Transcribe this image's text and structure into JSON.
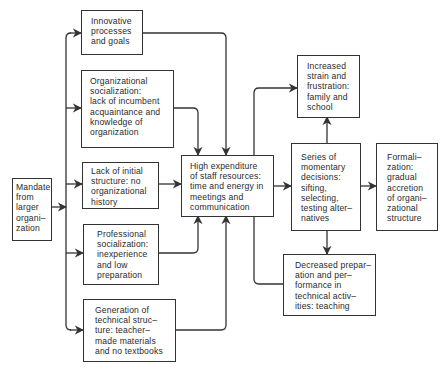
{
  "diagram": {
    "type": "flowchart",
    "colors": {
      "line": "#333333",
      "text": "#2a2a2a",
      "background": "#ffffff"
    },
    "nodes": {
      "mandate": {
        "label": "Mandate\nfrom\nlarger\norgani–\nzation"
      },
      "innovative": {
        "label": "Innovative\nprocesses\nand goals"
      },
      "org_socialization": {
        "label": "Organizational\nsocialization:\nlack of incumbent\nacquaintance and\nknowledge of\norganization"
      },
      "lack_structure": {
        "label": "Lack of initial\nstructure: no\norganizational\nhistory"
      },
      "prof_socialization": {
        "label": "Professional\nsocialization:\ninexperience\nand low\npreparation"
      },
      "generation": {
        "label": "Generation of\ntechnical struc–\nture: teacher–\nmade materials\nand no textbooks"
      },
      "high_expenditure": {
        "label": "High expenditure\nof staff resources:\ntime and energy in\nmeetings and\ncommunication"
      },
      "increased_strain": {
        "label": "Increased\nstrain and\nfrustration:\nfamily and\nschool"
      },
      "series_decisions": {
        "label": "Series of\nmomentary\ndecisions:\nsifting,\nselecting,\ntesting alter–\nnatives"
      },
      "formalization": {
        "label": "Formali–\nzation:\ngradual\naccretion\nof organi–\nzational\nstructure"
      },
      "decreased_prep": {
        "label": "Decreased prepar–\nation and per–\nformance in\ntechnical activ–\nities: teaching"
      }
    },
    "edges": [
      {
        "from": "mandate",
        "to": "innovative"
      },
      {
        "from": "mandate",
        "to": "org_socialization"
      },
      {
        "from": "mandate",
        "to": "lack_structure"
      },
      {
        "from": "mandate",
        "to": "prof_socialization"
      },
      {
        "from": "mandate",
        "to": "generation"
      },
      {
        "from": "innovative",
        "to": "high_expenditure"
      },
      {
        "from": "org_socialization",
        "to": "high_expenditure"
      },
      {
        "from": "lack_structure",
        "to": "high_expenditure"
      },
      {
        "from": "prof_socialization",
        "to": "high_expenditure"
      },
      {
        "from": "generation",
        "to": "high_expenditure"
      },
      {
        "from": "high_expenditure",
        "to": "increased_strain"
      },
      {
        "from": "high_expenditure",
        "to": "series_decisions"
      },
      {
        "from": "high_expenditure",
        "to": "decreased_prep"
      },
      {
        "from": "series_decisions",
        "to": "increased_strain"
      },
      {
        "from": "series_decisions",
        "to": "formalization"
      },
      {
        "from": "series_decisions",
        "to": "decreased_prep"
      }
    ]
  }
}
